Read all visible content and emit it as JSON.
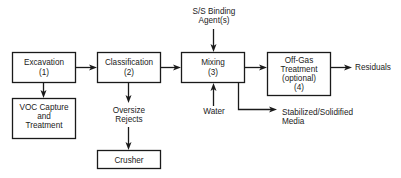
{
  "diagram": {
    "type": "process-flow",
    "nodes": {
      "excavation": {
        "lines": [
          "Excavation",
          "(1)"
        ]
      },
      "classification": {
        "lines": [
          "Classification",
          "(2)"
        ]
      },
      "mixing": {
        "lines": [
          "Mixing",
          "(3)"
        ]
      },
      "offgas": {
        "lines": [
          "Off-Gas",
          "Treatment",
          "(optional)",
          "(4)"
        ]
      },
      "voc": {
        "lines": [
          "VOC Capture",
          "and",
          "Treatment"
        ]
      },
      "crusher": {
        "lines": [
          "Crusher"
        ]
      }
    },
    "labels": {
      "binding": [
        "S/S Binding",
        "Agent(s)"
      ],
      "water": [
        "Water"
      ],
      "residuals": [
        "Residuals"
      ],
      "oversize": [
        "Oversize",
        "Rejects"
      ],
      "stabilized": [
        "Stabilized/Solidified",
        "Media"
      ]
    },
    "edges": [
      {
        "from": "Excavation",
        "to": "Classification"
      },
      {
        "from": "Classification",
        "to": "Mixing"
      },
      {
        "from": "Mixing",
        "to": "Off-Gas Treatment"
      },
      {
        "from": "Off-Gas Treatment",
        "to": "Residuals"
      },
      {
        "from": "Excavation",
        "to": "VOC Capture and Treatment"
      },
      {
        "from": "Classification",
        "to": "Oversize Rejects"
      },
      {
        "from": "Oversize Rejects",
        "to": "Crusher"
      },
      {
        "from": "S/S Binding Agent(s)",
        "to": "Mixing"
      },
      {
        "from": "Water",
        "to": "Mixing"
      },
      {
        "from": "Mixing",
        "to": "Stabilized/Solidified Media"
      }
    ]
  }
}
